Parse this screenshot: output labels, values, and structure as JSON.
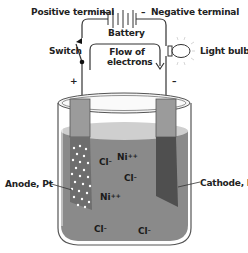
{
  "labels": {
    "positive_terminal": "Positive terminal",
    "plus_sign": "+",
    "minus_sign": "–",
    "negative_terminal": "Negative terminal",
    "battery": "Battery",
    "switch": "Switch",
    "flow_line1": "Flow of",
    "flow_line2": "electrons",
    "light_bulb": "Light bulb",
    "left_plus": "+",
    "right_minus": "–",
    "anode": "Anode, Pt",
    "cathode": "Cathode, Pt"
  },
  "ions": [
    {
      "symbol": "Ni",
      "charge": "++"
    },
    {
      "symbol": "Cl",
      "charge": "–"
    },
    {
      "symbol": "Cl",
      "charge": "–"
    },
    {
      "symbol": "Ni",
      "charge": "++"
    },
    {
      "symbol": "Cl",
      "charge": "–"
    },
    {
      "symbol": "Cl",
      "charge": "–"
    }
  ],
  "colors": {
    "solution": "#8a8a8a",
    "solution_top": "#c8c8c8",
    "electrode": "#9a9a9a",
    "cathode_dark": "#555555",
    "wire": "#333333"
  }
}
